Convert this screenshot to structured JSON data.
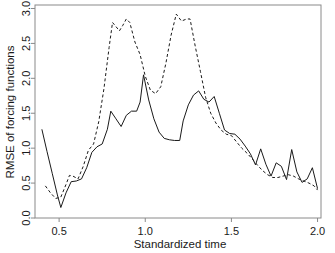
{
  "chart_data": {
    "type": "line",
    "title": "",
    "xlabel": "Standardized time",
    "ylabel": "RMSE of forcing functions",
    "xlim": [
      0.36,
      2.02
    ],
    "ylim": [
      0.0,
      3.05
    ],
    "xticks": [
      0.5,
      1.0,
      1.5,
      2.0
    ],
    "xtick_labels": [
      "0.5",
      "1.0",
      "1.5",
      "2.0"
    ],
    "yticks": [
      0.0,
      0.5,
      1.0,
      1.5,
      2.0,
      2.5,
      3.0
    ],
    "ytick_labels": [
      "0.0",
      "0.5",
      "1.0",
      "1.5",
      "2.0",
      "2.5",
      "3.0"
    ],
    "grid": false,
    "legend": null,
    "series": [
      {
        "name": "solid-curve",
        "style": "solid",
        "color": "#1a1a1a",
        "x": [
          0.4,
          0.43,
          0.46,
          0.49,
          0.51,
          0.54,
          0.57,
          0.6,
          0.63,
          0.66,
          0.69,
          0.72,
          0.75,
          0.78,
          0.8,
          0.83,
          0.86,
          0.89,
          0.92,
          0.95,
          0.97,
          0.99,
          1.02,
          1.05,
          1.08,
          1.11,
          1.14,
          1.17,
          1.2,
          1.22,
          1.25,
          1.28,
          1.31,
          1.34,
          1.37,
          1.4,
          1.43,
          1.46,
          1.49,
          1.52,
          1.55,
          1.58,
          1.61,
          1.64,
          1.67,
          1.7,
          1.73,
          1.76,
          1.79,
          1.82,
          1.85,
          1.88,
          1.91,
          1.94,
          1.97,
          2.0
        ],
        "y": [
          1.27,
          0.95,
          0.64,
          0.33,
          0.15,
          0.36,
          0.52,
          0.53,
          0.56,
          0.72,
          0.94,
          1.02,
          1.06,
          1.27,
          1.53,
          1.42,
          1.31,
          1.47,
          1.53,
          1.53,
          1.66,
          2.05,
          1.69,
          1.42,
          1.23,
          1.14,
          1.12,
          1.11,
          1.11,
          1.39,
          1.62,
          1.76,
          1.82,
          1.7,
          1.66,
          1.74,
          1.5,
          1.26,
          1.21,
          1.2,
          1.13,
          1.03,
          0.92,
          0.76,
          0.99,
          0.77,
          0.6,
          0.79,
          0.74,
          0.55,
          0.98,
          0.66,
          0.51,
          0.56,
          0.72,
          0.42
        ]
      },
      {
        "name": "dashed-curve",
        "style": "dashed",
        "color": "#1a1a1a",
        "x": [
          0.42,
          0.45,
          0.48,
          0.51,
          0.54,
          0.56,
          0.58,
          0.61,
          0.64,
          0.67,
          0.7,
          0.73,
          0.76,
          0.79,
          0.81,
          0.83,
          0.85,
          0.87,
          0.89,
          0.91,
          0.94,
          0.97,
          1.0,
          1.03,
          1.06,
          1.09,
          1.12,
          1.15,
          1.18,
          1.21,
          1.24,
          1.26,
          1.29,
          1.32,
          1.35,
          1.38,
          1.41,
          1.44,
          1.47,
          1.5,
          1.53,
          1.56,
          1.59,
          1.62,
          1.65,
          1.68,
          1.71,
          1.74,
          1.77,
          1.8,
          1.83,
          1.86,
          1.89,
          1.92,
          1.95,
          1.98,
          2.0
        ],
        "y": [
          0.46,
          0.36,
          0.28,
          0.3,
          0.48,
          0.61,
          0.6,
          0.56,
          0.74,
          0.97,
          1.06,
          1.38,
          1.85,
          2.44,
          2.8,
          2.74,
          2.68,
          2.76,
          2.85,
          2.8,
          2.52,
          2.34,
          2.03,
          1.83,
          1.78,
          1.88,
          2.22,
          2.62,
          2.92,
          2.82,
          2.85,
          2.85,
          2.46,
          2.1,
          1.73,
          1.5,
          1.36,
          1.26,
          1.2,
          1.18,
          1.09,
          1.0,
          0.93,
          0.85,
          0.76,
          0.68,
          0.62,
          0.58,
          0.58,
          0.6,
          0.62,
          0.6,
          0.56,
          0.53,
          0.5,
          0.46,
          0.4
        ]
      }
    ]
  }
}
